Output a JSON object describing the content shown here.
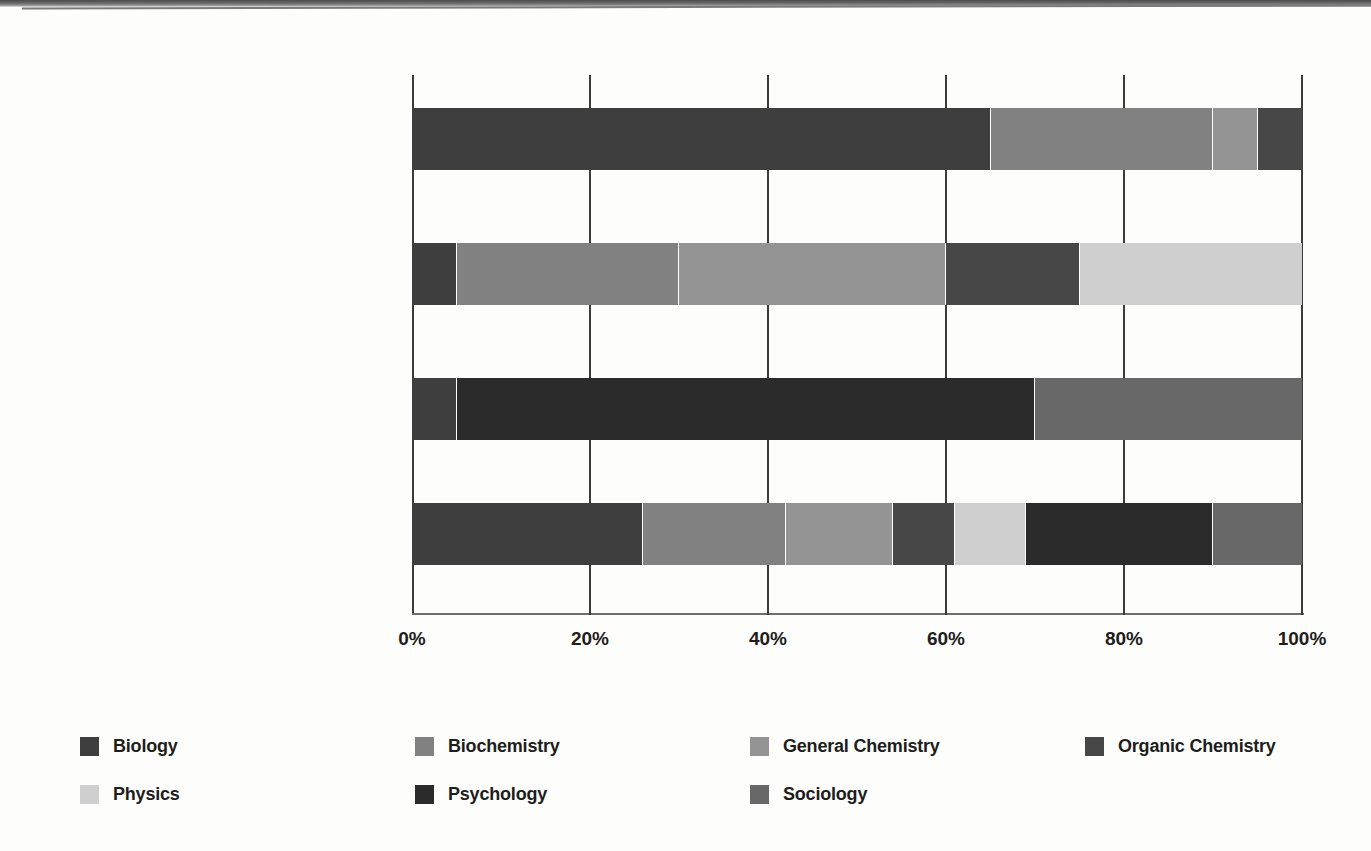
{
  "chart_data": {
    "type": "bar",
    "orientation": "horizontal",
    "stacked": true,
    "normalized": true,
    "title": "",
    "subtitle": "",
    "xlabel": "",
    "ylabel": "",
    "xlim": [
      0,
      100
    ],
    "grid": true,
    "legend_position": "bottom",
    "xticks": [
      {
        "value": 0,
        "label": "0%"
      },
      {
        "value": 20,
        "label": "20%"
      },
      {
        "value": 40,
        "label": "40%"
      },
      {
        "value": 60,
        "label": "60%"
      },
      {
        "value": 80,
        "label": "80%"
      },
      {
        "value": 100,
        "label": "100%"
      }
    ],
    "categories": [
      {
        "main": "Biological and Biochemical",
        "sub": "Foundations of Living Systems"
      },
      {
        "main": "Chemical and Physical",
        "sub": "Foundations of Biological Systems"
      },
      {
        "main": "Psychological, Social, and Biological",
        "sub": "Foundations of Behavior"
      },
      {
        "main": "MCAT",
        "sub": ""
      }
    ],
    "series": [
      {
        "name": "Biology",
        "color": "#3e3e3e",
        "values": [
          65,
          5,
          5,
          26
        ]
      },
      {
        "name": "Biochemistry",
        "color": "#818181",
        "values": [
          25,
          25,
          0,
          16
        ]
      },
      {
        "name": "General Chemistry",
        "color": "#949494",
        "values": [
          5,
          30,
          0,
          12
        ]
      },
      {
        "name": "Organic Chemistry",
        "color": "#474747",
        "values": [
          5,
          15,
          0,
          7
        ]
      },
      {
        "name": "Physics",
        "color": "#cfcfcf",
        "values": [
          0,
          25,
          0,
          8
        ]
      },
      {
        "name": "Psychology",
        "color": "#2b2b2b",
        "values": [
          0,
          0,
          65,
          21
        ]
      },
      {
        "name": "Sociology",
        "color": "#686868",
        "values": [
          0,
          0,
          30,
          10
        ]
      }
    ],
    "bars": [
      {
        "category": "Biological and Biochemical",
        "segments": [
          {
            "name": "Biology",
            "value": 65,
            "color": "#3e3e3e"
          },
          {
            "name": "Biochemistry",
            "value": 25,
            "color": "#818181"
          },
          {
            "name": "General Chemistry",
            "value": 5,
            "color": "#949494"
          },
          {
            "name": "Organic Chemistry",
            "value": 5,
            "color": "#474747"
          }
        ]
      },
      {
        "category": "Chemical and Physical",
        "segments": [
          {
            "name": "Biology",
            "value": 5,
            "color": "#3e3e3e"
          },
          {
            "name": "Biochemistry",
            "value": 25,
            "color": "#818181"
          },
          {
            "name": "General Chemistry",
            "value": 30,
            "color": "#949494"
          },
          {
            "name": "Organic Chemistry",
            "value": 15,
            "color": "#474747"
          },
          {
            "name": "Physics",
            "value": 25,
            "color": "#cfcfcf"
          }
        ]
      },
      {
        "category": "Psychological, Social, and Biological",
        "segments": [
          {
            "name": "Biology",
            "value": 5,
            "color": "#3e3e3e"
          },
          {
            "name": "Psychology",
            "value": 65,
            "color": "#2b2b2b"
          },
          {
            "name": "Sociology",
            "value": 30,
            "color": "#686868"
          }
        ]
      },
      {
        "category": "MCAT",
        "segments": [
          {
            "name": "Biology",
            "value": 26,
            "color": "#3e3e3e"
          },
          {
            "name": "Biochemistry",
            "value": 16,
            "color": "#818181"
          },
          {
            "name": "General Chemistry",
            "value": 12,
            "color": "#949494"
          },
          {
            "name": "Organic Chemistry",
            "value": 7,
            "color": "#474747"
          },
          {
            "name": "Physics",
            "value": 8,
            "color": "#cfcfcf"
          },
          {
            "name": "Psychology",
            "value": 21,
            "color": "#2b2b2b"
          },
          {
            "name": "Sociology",
            "value": 10,
            "color": "#686868"
          }
        ]
      }
    ],
    "legend": [
      [
        {
          "label": "Biology",
          "color": "#3e3e3e"
        },
        {
          "label": "Biochemistry",
          "color": "#818181"
        },
        {
          "label": "General Chemistry",
          "color": "#949494"
        },
        {
          "label": "Organic Chemistry",
          "color": "#474747"
        }
      ],
      [
        {
          "label": "Physics",
          "color": "#cfcfcf"
        },
        {
          "label": "Psychology",
          "color": "#2b2b2b"
        },
        {
          "label": "Sociology",
          "color": "#686868"
        }
      ]
    ]
  }
}
